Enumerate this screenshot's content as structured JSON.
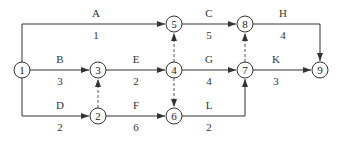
{
  "diagram": {
    "type": "activity-on-arrow network",
    "nodes": [
      {
        "id": "1",
        "label": "1",
        "x": 22,
        "y": 70
      },
      {
        "id": "2",
        "label": "2",
        "x": 98,
        "y": 116
      },
      {
        "id": "3",
        "label": "3",
        "x": 98,
        "y": 70
      },
      {
        "id": "4",
        "label": "4",
        "x": 174,
        "y": 70
      },
      {
        "id": "5",
        "label": "5",
        "x": 174,
        "y": 24
      },
      {
        "id": "6",
        "label": "6",
        "x": 174,
        "y": 116
      },
      {
        "id": "7",
        "label": "7",
        "x": 245,
        "y": 70
      },
      {
        "id": "8",
        "label": "8",
        "x": 245,
        "y": 24
      },
      {
        "id": "9",
        "label": "9",
        "x": 320,
        "y": 70
      }
    ],
    "activities": [
      {
        "name": "A",
        "duration": "1",
        "from": "1",
        "to": "5"
      },
      {
        "name": "B",
        "duration": "3",
        "from": "1",
        "to": "3"
      },
      {
        "name": "C",
        "duration": "5",
        "from": "5",
        "to": "8"
      },
      {
        "name": "D",
        "duration": "2",
        "from": "1",
        "to": "2"
      },
      {
        "name": "E",
        "duration": "2",
        "from": "3",
        "to": "4"
      },
      {
        "name": "F",
        "duration": "6",
        "from": "2",
        "to": "6"
      },
      {
        "name": "G",
        "duration": "4",
        "from": "4",
        "to": "7"
      },
      {
        "name": "H",
        "duration": "4",
        "from": "8",
        "to": "9"
      },
      {
        "name": "K",
        "duration": "3",
        "from": "7",
        "to": "9"
      },
      {
        "name": "L",
        "duration": "2",
        "from": "6",
        "to": "7"
      }
    ],
    "dummy_activities": [
      {
        "from": "2",
        "to": "3"
      },
      {
        "from": "4",
        "to": "5"
      },
      {
        "from": "4",
        "to": "6"
      },
      {
        "from": "7",
        "to": "8"
      }
    ]
  }
}
